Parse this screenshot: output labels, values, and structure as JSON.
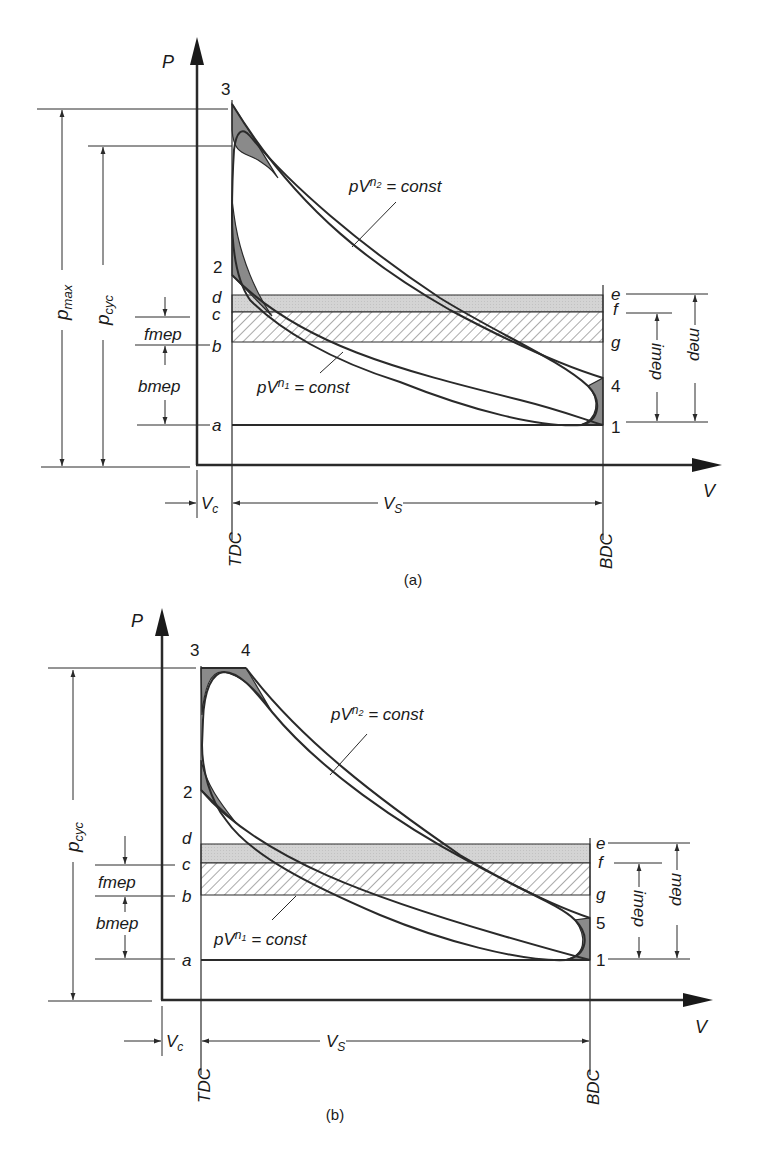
{
  "figure": {
    "colors": {
      "line": "#2a2a2a",
      "loss_fill": "#8a8a8a",
      "friction_band_fill": "#d4d4d4",
      "hatch": "#555555",
      "background": "#ffffff"
    },
    "caption": "",
    "panels": [
      {
        "id": "a",
        "panel_label": "(a)",
        "y_axis_label": "P",
        "x_axis_label": "V",
        "point_labels": {
          "p3": "3",
          "p2": "2",
          "p4": "4",
          "p1": "1"
        },
        "level_labels_left": {
          "d": "d",
          "c": "c",
          "b": "b",
          "a": "a"
        },
        "level_labels_right": {
          "e": "e",
          "f": "f",
          "g": "g"
        },
        "dimension_labels": {
          "pmax": "p",
          "pmax_sub": "max",
          "pcyc": "p",
          "pcyc_sub": "cyc",
          "fmep": "fmep",
          "bmep": "bmep",
          "imep": "imep",
          "mep": "mep",
          "vc": "V",
          "vc_sub": "c",
          "vs": "V",
          "vs_sub": "S",
          "tdc": "TDC",
          "bdc": "BDC"
        },
        "curve_labels": {
          "expansion": {
            "pre": "pV",
            "exp": "n",
            "exp_sub": "2",
            "post": " = const"
          },
          "compression": {
            "pre": "pV",
            "exp": "n",
            "exp_sub": "1",
            "post": " = const"
          }
        }
      },
      {
        "id": "b",
        "panel_label": "(b)",
        "y_axis_label": "P",
        "x_axis_label": "V",
        "point_labels": {
          "p3": "3",
          "p4": "4",
          "p2": "2",
          "p5": "5",
          "p1": "1"
        },
        "level_labels_left": {
          "d": "d",
          "c": "c",
          "b": "b",
          "a": "a"
        },
        "level_labels_right": {
          "e": "e",
          "f": "f",
          "g": "g"
        },
        "dimension_labels": {
          "pcyc": "p",
          "pcyc_sub": "cyc",
          "fmep": "fmep",
          "bmep": "bmep",
          "imep": "imep",
          "mep": "mep",
          "vc": "V",
          "vc_sub": "c",
          "vs": "V",
          "vs_sub": "S",
          "tdc": "TDC",
          "bdc": "BDC"
        },
        "curve_labels": {
          "expansion": {
            "pre": "pV",
            "exp": "n",
            "exp_sub": "2",
            "post": " = const"
          },
          "compression": {
            "pre": "pV",
            "exp": "n",
            "exp_sub": "1",
            "post": " = const"
          }
        }
      }
    ]
  }
}
